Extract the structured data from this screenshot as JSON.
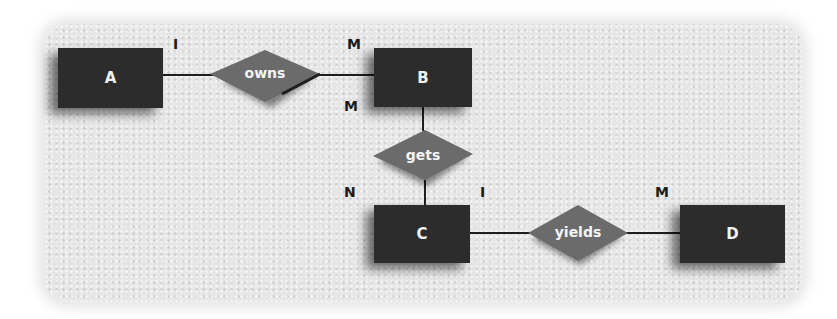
{
  "diagram": {
    "type": "entity-relationship",
    "entities": [
      {
        "id": "A",
        "label": "A"
      },
      {
        "id": "B",
        "label": "B"
      },
      {
        "id": "C",
        "label": "C"
      },
      {
        "id": "D",
        "label": "D"
      }
    ],
    "relationships": [
      {
        "id": "owns",
        "label": "owns",
        "from": "A",
        "to": "B",
        "from_card": "I",
        "to_card": "M"
      },
      {
        "id": "gets",
        "label": "gets",
        "from": "B",
        "to": "C",
        "from_card": "M",
        "to_card": "N"
      },
      {
        "id": "yields",
        "label": "yields",
        "from": "C",
        "to": "D",
        "from_card": "I",
        "to_card": "M"
      }
    ],
    "cardinalities": {
      "a_owns": "I",
      "b_owns": "M",
      "b_gets": "M",
      "c_gets": "N",
      "c_yields": "I",
      "d_yields": "M"
    },
    "colors": {
      "entity_fill": "#2c2c2c",
      "relationship_fill": "#6b6b6b",
      "line": "#1e1e1e",
      "background": "#e6e6e6"
    }
  }
}
